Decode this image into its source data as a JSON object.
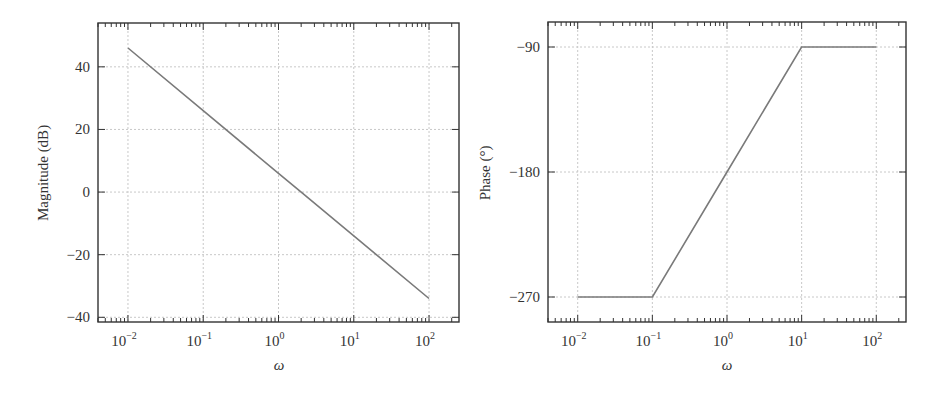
{
  "chart_data": [
    {
      "type": "line",
      "title": "",
      "xlabel": "ω",
      "ylabel": "Magnitude (dB)",
      "xscale": "log",
      "xlim": [
        0.004,
        250
      ],
      "ylim": [
        -41.5,
        54
      ],
      "xticks": [
        0.01,
        0.1,
        1,
        10,
        100
      ],
      "xtick_labels": [
        {
          "base": "10",
          "exp": "−2"
        },
        {
          "base": "10",
          "exp": "−1"
        },
        {
          "base": "10",
          "exp": "0"
        },
        {
          "base": "10",
          "exp": "1"
        },
        {
          "base": "10",
          "exp": "2"
        }
      ],
      "yticks": [
        40,
        20,
        0,
        -20,
        -40
      ],
      "ytick_labels": [
        "40",
        "20",
        "0",
        "−20",
        "−40"
      ],
      "grid": true,
      "series": [
        {
          "name": "Magnitude",
          "color": "#7a7a7a",
          "x": [
            0.01,
            0.1,
            1,
            2,
            10,
            100
          ],
          "y": [
            46,
            26,
            6,
            0,
            -14,
            -34
          ]
        }
      ]
    },
    {
      "type": "line",
      "title": "",
      "xlabel": "ω",
      "ylabel": "Phase (°)",
      "xscale": "log",
      "xlim": [
        0.004,
        250
      ],
      "ylim": [
        -288,
        -72
      ],
      "xticks": [
        0.01,
        0.1,
        1,
        10,
        100
      ],
      "xtick_labels": [
        {
          "base": "10",
          "exp": "−2"
        },
        {
          "base": "10",
          "exp": "−1"
        },
        {
          "base": "10",
          "exp": "0"
        },
        {
          "base": "10",
          "exp": "1"
        },
        {
          "base": "10",
          "exp": "2"
        }
      ],
      "yticks": [
        -90,
        -180,
        -270
      ],
      "ytick_labels": [
        "−90",
        "−180",
        "−270"
      ],
      "grid": true,
      "series": [
        {
          "name": "Phase",
          "color": "#7a7a7a",
          "x": [
            0.01,
            0.1,
            1,
            10,
            100
          ],
          "y": [
            -270,
            -270,
            -180,
            -90,
            -90
          ]
        }
      ]
    }
  ],
  "plots": [
    {
      "ylabel": "Magnitude (dB)",
      "xlabel": "ω"
    },
    {
      "ylabel": "Phase (°)",
      "xlabel": "ω"
    }
  ],
  "colors": {
    "axes": "#333333",
    "grid": "#c8c8c8",
    "line": "#7a7a7a"
  }
}
